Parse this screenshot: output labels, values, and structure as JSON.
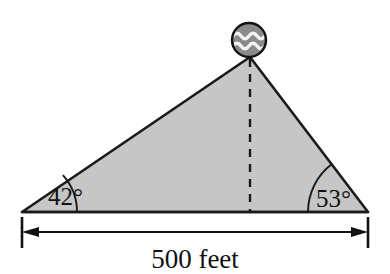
{
  "figure": {
    "background_color": "#ffffff",
    "triangle": {
      "fill_color": "#c6c6c6",
      "stroke_color": "#1a1a1a",
      "vertices": {
        "left": [
          22,
          212
        ],
        "right": [
          368,
          212
        ],
        "apex": [
          250,
          57
        ]
      }
    },
    "angles": {
      "left": {
        "label": "42°",
        "value": 42,
        "unit": "degrees",
        "arc_radius": 55
      },
      "right": {
        "label": "53°",
        "value": 53,
        "unit": "degrees",
        "arc_radius": 60
      },
      "apex_implied": {
        "value": 85,
        "unit": "degrees"
      }
    },
    "altitude": {
      "style": "dashed",
      "from": [
        250,
        57
      ],
      "to": [
        250,
        212
      ],
      "stroke_color": "#1a1a1a"
    },
    "beacon": {
      "icon": "aquarius-wave-circle-icon",
      "center": [
        249,
        40
      ],
      "radius": 17,
      "fill_color": "#8a8a8a",
      "stroke_color": "#111111",
      "wave_color": "#f2f2f2",
      "wave_bands": 2
    },
    "dimension": {
      "label": "500 feet",
      "value": 500,
      "unit": "feet",
      "line_y": 232,
      "x_start": 22,
      "x_end": 368,
      "arrow_style": "double-headed",
      "extension_ticks": true,
      "stroke_color": "#111111"
    }
  }
}
